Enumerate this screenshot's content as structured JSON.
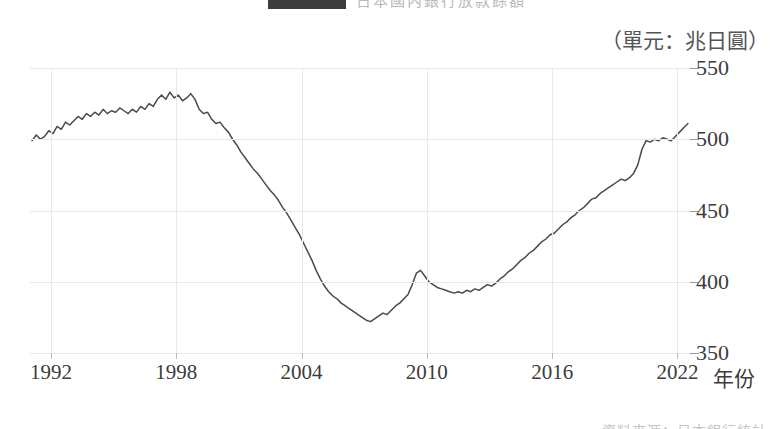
{
  "figure": {
    "unit_caption": "（單元：兆日圓）",
    "x_axis_title": "年份",
    "legend_label": "日本國內銀行放款餘額",
    "source_note": "資料來源：日本銀行統計"
  },
  "chart_data": {
    "type": "line",
    "title": "",
    "subtitle": "",
    "xlabel": "年份",
    "ylabel": "",
    "unit": "兆日圓",
    "grid": true,
    "legend_position": "top",
    "xlim": [
      1991.0,
      2022.6
    ],
    "ylim": [
      350,
      550
    ],
    "xticks": [
      1992,
      1998,
      2004,
      2010,
      2016,
      2022
    ],
    "xticklabels": [
      "1992",
      "1998",
      "2004",
      "2010",
      "2016",
      "2022"
    ],
    "yticks": [
      350,
      400,
      450,
      500,
      550
    ],
    "yticklabels": [
      "350",
      "400",
      "450",
      "500",
      "550"
    ],
    "line_color": "#4a4a4a",
    "series": [
      {
        "name": "日本國內銀行放款餘額",
        "x": [
          1991.1,
          1991.3,
          1991.5,
          1991.7,
          1991.9,
          1992.1,
          1992.3,
          1992.5,
          1992.7,
          1992.9,
          1993.1,
          1993.3,
          1993.5,
          1993.7,
          1993.9,
          1994.1,
          1994.3,
          1994.5,
          1994.7,
          1994.9,
          1995.1,
          1995.3,
          1995.5,
          1995.7,
          1995.9,
          1996.1,
          1996.3,
          1996.5,
          1996.7,
          1996.9,
          1997.1,
          1997.3,
          1997.5,
          1997.7,
          1997.9,
          1998.1,
          1998.3,
          1998.5,
          1998.7,
          1998.9,
          1999.1,
          1999.3,
          1999.5,
          1999.7,
          1999.9,
          2000.1,
          2000.3,
          2000.5,
          2000.7,
          2000.9,
          2001.1,
          2001.3,
          2001.5,
          2001.7,
          2001.9,
          2002.1,
          2002.3,
          2002.5,
          2002.7,
          2002.9,
          2003.1,
          2003.3,
          2003.5,
          2003.7,
          2003.9,
          2004.1,
          2004.3,
          2004.5,
          2004.7,
          2004.9,
          2005.1,
          2005.3,
          2005.5,
          2005.7,
          2005.9,
          2006.1,
          2006.3,
          2006.5,
          2006.7,
          2006.9,
          2007.1,
          2007.3,
          2007.5,
          2007.7,
          2007.9,
          2008.1,
          2008.3,
          2008.5,
          2008.7,
          2008.9,
          2009.1,
          2009.3,
          2009.5,
          2009.7,
          2009.9,
          2010.1,
          2010.3,
          2010.5,
          2010.7,
          2010.9,
          2011.1,
          2011.3,
          2011.5,
          2011.7,
          2011.9,
          2012.1,
          2012.3,
          2012.5,
          2012.7,
          2012.9,
          2013.1,
          2013.3,
          2013.5,
          2013.7,
          2013.9,
          2014.1,
          2014.3,
          2014.5,
          2014.7,
          2014.9,
          2015.1,
          2015.3,
          2015.5,
          2015.7,
          2015.9,
          2016.1,
          2016.3,
          2016.5,
          2016.7,
          2016.9,
          2017.1,
          2017.3,
          2017.5,
          2017.7,
          2017.9,
          2018.1,
          2018.3,
          2018.5,
          2018.7,
          2018.9,
          2019.1,
          2019.3,
          2019.5,
          2019.7,
          2019.9,
          2020.1,
          2020.3,
          2020.5,
          2020.7,
          2020.9,
          2021.1,
          2021.3,
          2021.5,
          2021.7,
          2021.9,
          2022.1,
          2022.3,
          2022.5
        ],
        "values": [
          499,
          503,
          500,
          502,
          506,
          504,
          509,
          507,
          512,
          510,
          513,
          516,
          514,
          518,
          516,
          519,
          517,
          521,
          518,
          520,
          519,
          522,
          520,
          518,
          521,
          519,
          523,
          521,
          525,
          523,
          528,
          531,
          528,
          533,
          529,
          531,
          527,
          529,
          532,
          528,
          521,
          518,
          519,
          514,
          511,
          512,
          508,
          505,
          500,
          496,
          491,
          487,
          483,
          479,
          476,
          472,
          468,
          464,
          461,
          457,
          452,
          448,
          443,
          438,
          433,
          427,
          421,
          415,
          408,
          402,
          397,
          393,
          390,
          388,
          385,
          383,
          381,
          379,
          377,
          375,
          373,
          372,
          374,
          376,
          378,
          377,
          380,
          383,
          385,
          388,
          391,
          398,
          406,
          408,
          404,
          400,
          398,
          396,
          395,
          394,
          393,
          392,
          393,
          392,
          394,
          393,
          395,
          394,
          396,
          398,
          397,
          399,
          402,
          404,
          407,
          409,
          412,
          415,
          417,
          420,
          422,
          425,
          428,
          430,
          433,
          434,
          437,
          440,
          442,
          445,
          447,
          450,
          452,
          455,
          458,
          459,
          462,
          464,
          466,
          468,
          470,
          472,
          471,
          473,
          476,
          482,
          493,
          499,
          498,
          500,
          499,
          501,
          500,
          499,
          502,
          505,
          508,
          511
        ]
      }
    ]
  }
}
